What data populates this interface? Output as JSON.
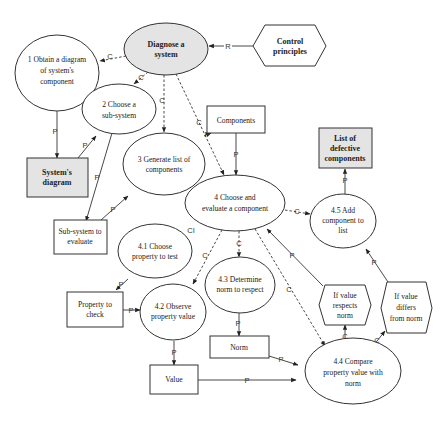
{
  "diagram": {
    "nodes": {
      "diagnose": {
        "lines": [
          "Diagnose a",
          "system"
        ],
        "shape": "ellipse",
        "fill": "#e4e4e4",
        "bold": true
      },
      "control": {
        "lines": [
          "Control",
          "principles"
        ],
        "shape": "hexagon",
        "bold": true
      },
      "obtain": {
        "lines": [
          "1 Obtain a diagram",
          "of system's",
          "component"
        ],
        "shape": "ellipse"
      },
      "choose_sub": {
        "lines": [
          "2 Choose a",
          "sub-system"
        ],
        "shape": "ellipse"
      },
      "generate": {
        "lines": [
          "3 Generate list of",
          "components"
        ],
        "shape": "ellipse"
      },
      "sys_diagram": {
        "lines": [
          "System's",
          "diagram"
        ],
        "shape": "rect",
        "fill": "#e4e4e4",
        "bold": true
      },
      "components": {
        "lines": [
          "Components"
        ],
        "shape": "rect"
      },
      "choose_eval": {
        "lines": [
          "4 Choose and",
          "evaluate a component"
        ],
        "shape": "ellipse"
      },
      "defective": {
        "lines": [
          "List of",
          "defective",
          "components"
        ],
        "shape": "rect",
        "fill": "#e4e4e4",
        "bold": true
      },
      "add": {
        "lines": [
          "4.5 Add",
          "component to",
          "list"
        ],
        "shape": "ellipse"
      },
      "sub_eval": {
        "lines": [
          "Sub-system to",
          "evaluate"
        ],
        "shape": "rect"
      },
      "choose_prop": {
        "lines": [
          "4.1 Choose",
          "property to test"
        ],
        "shape": "ellipse"
      },
      "prop_check": {
        "lines": [
          "Property to",
          "check"
        ],
        "shape": "rect"
      },
      "observe": {
        "lines": [
          "4.2 Observe",
          "property value"
        ],
        "shape": "ellipse"
      },
      "determine": {
        "lines": [
          "4.3 Determine",
          "norm to respect"
        ],
        "shape": "ellipse"
      },
      "norm": {
        "lines": [
          "Norm"
        ],
        "shape": "rect"
      },
      "value": {
        "lines": [
          "Value"
        ],
        "shape": "rect"
      },
      "respects": {
        "lines": [
          "If value",
          "respects",
          "norm"
        ],
        "shape": "hexagon"
      },
      "differs": {
        "lines": [
          "If value",
          "differs",
          "from norm"
        ],
        "shape": "hexagon"
      },
      "compare": {
        "lines": [
          "4.4 Compare",
          "property value with",
          "norm"
        ],
        "shape": "ellipse"
      }
    },
    "edge_labels": {
      "R": "R",
      "C": "C",
      "P": "P",
      "CI": "CI"
    },
    "edges": [
      {
        "from": "control",
        "to": "diagnose",
        "label": "R",
        "style": "solid"
      },
      {
        "from": "diagnose",
        "to": "obtain",
        "label": "C",
        "style": "dashed"
      },
      {
        "from": "diagnose",
        "to": "choose_sub",
        "label": "C",
        "style": "dashed"
      },
      {
        "from": "diagnose",
        "to": "generate",
        "label": "C",
        "style": "dashed"
      },
      {
        "from": "diagnose",
        "to": "choose_eval",
        "label": "C",
        "style": "dashed"
      },
      {
        "from": "obtain",
        "to": "sys_diagram",
        "label": "P",
        "style": "solid"
      },
      {
        "from": "sys_diagram",
        "to": "choose_sub",
        "label": "P",
        "style": "solid"
      },
      {
        "from": "choose_sub",
        "to": "sub_eval",
        "label": "P",
        "style": "solid"
      },
      {
        "from": "sub_eval",
        "to": "generate",
        "label": "P",
        "style": "solid"
      },
      {
        "from": "generate",
        "to": "components",
        "label": "P",
        "style": "solid"
      },
      {
        "from": "components",
        "to": "choose_eval",
        "label": "P",
        "style": "solid"
      },
      {
        "from": "choose_eval",
        "to": "add",
        "label": "C",
        "style": "dashed"
      },
      {
        "from": "add",
        "to": "defective",
        "label": "P",
        "style": "solid"
      },
      {
        "from": "choose_eval",
        "to": "observe",
        "label": "C",
        "style": "dashed"
      },
      {
        "from": "choose_eval",
        "to": "determine",
        "label": "C",
        "style": "dashed"
      },
      {
        "from": "choose_eval",
        "to": "compare",
        "label": "C",
        "style": "dashed"
      },
      {
        "from": "choose_prop",
        "to": "prop_check",
        "label": "P",
        "style": "solid"
      },
      {
        "from": "prop_check",
        "to": "observe",
        "label": "P",
        "style": "solid"
      },
      {
        "from": "observe",
        "to": "value",
        "label": "P",
        "style": "solid"
      },
      {
        "from": "determine",
        "to": "norm",
        "label": "P",
        "style": "solid"
      },
      {
        "from": "norm",
        "to": "compare",
        "label": "P",
        "style": "solid"
      },
      {
        "from": "value",
        "to": "compare",
        "label": "P",
        "style": "solid"
      },
      {
        "from": "compare",
        "to": "respects",
        "label": "C",
        "style": "solid"
      },
      {
        "from": "compare",
        "to": "differs",
        "label": "C",
        "style": "solid"
      },
      {
        "from": "respects",
        "to": "choose_eval",
        "label": "P",
        "style": "solid"
      },
      {
        "from": "differs",
        "to": "add",
        "label": "P",
        "style": "solid"
      }
    ]
  }
}
